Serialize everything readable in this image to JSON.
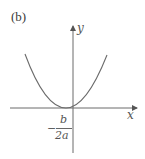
{
  "figure": {
    "panel_label": "(b)",
    "x_axis_label": "x",
    "y_axis_label": "y",
    "vertex_label": {
      "sign": "−",
      "numerator": "b",
      "denominator": "2a"
    },
    "curve_color": "#6b6b6b",
    "axis_color": "#6b6b6b",
    "curve": "upward-opening parabola with vertex at x = −b/(2a), touching x-axis"
  }
}
